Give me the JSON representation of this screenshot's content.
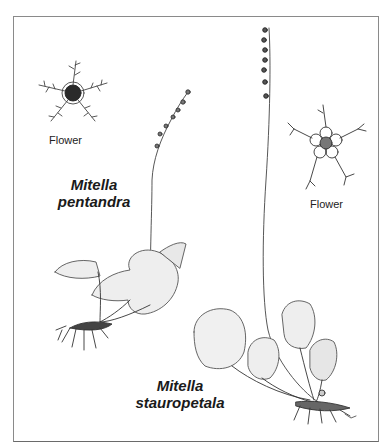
{
  "illustration": {
    "species": [
      {
        "genus": "Mitella",
        "epithet": "pentandra"
      },
      {
        "genus": "Mitella",
        "epithet": "stauropetala"
      }
    ],
    "labels": {
      "flower_left": "Flower",
      "flower_right": "Flower"
    }
  }
}
